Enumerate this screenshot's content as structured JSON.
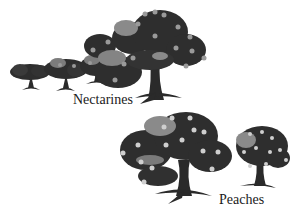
{
  "figure": {
    "groups": [
      {
        "label": "Nectarines",
        "description": "Row of trees growing in size left to right, fruit shown as grey dots"
      },
      {
        "label": "Peaches",
        "description": "Two trees, large and smaller, fruit shown as light dots"
      }
    ],
    "colors": {
      "canopy_dark": "#2e2e2e",
      "canopy_mid": "#8a8a8a",
      "fruit_nectarine": "#9a9a9a",
      "fruit_peach": "#cfcfcf",
      "trunk": "#2a2a2a",
      "background": "#ffffff"
    }
  }
}
